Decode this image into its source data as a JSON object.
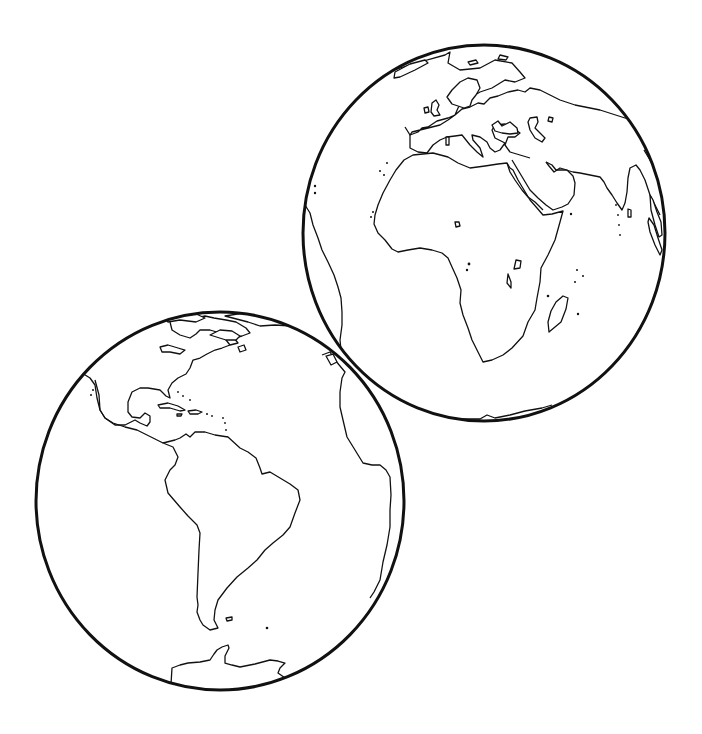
{
  "image": {
    "description": "Black-and-white line-art illustration of two overlapping Earth globes",
    "background_color": "#ffffff",
    "line_color": "#111111"
  },
  "globes": [
    {
      "id": "eastern-hemisphere",
      "label": "Eastern Hemisphere globe",
      "position": "upper-right",
      "center": [
        484,
        233
      ],
      "radius": [
        181,
        188
      ],
      "visible_landmasses": [
        "Africa",
        "Europe",
        "Arabian Peninsula",
        "India",
        "Madagascar",
        "Southeast Asia",
        "South America (edge)",
        "Antarctica (edge)"
      ]
    },
    {
      "id": "western-hemisphere",
      "label": "Western Hemisphere globe",
      "position": "lower-left",
      "center": [
        220,
        501
      ],
      "radius": [
        184,
        189
      ],
      "visible_landmasses": [
        "North America",
        "Central America",
        "Caribbean",
        "South America",
        "Antarctica",
        "Africa (edge)",
        "Europe (edge)"
      ]
    }
  ]
}
